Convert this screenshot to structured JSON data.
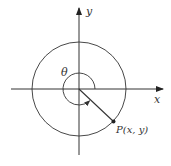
{
  "diagram": {
    "axes": {
      "x_label": "x",
      "y_label": "y"
    },
    "angle_label": "θ",
    "point_label": "P(x, y)",
    "colors": {
      "stroke": "#333333",
      "background": "#ffffff"
    }
  }
}
